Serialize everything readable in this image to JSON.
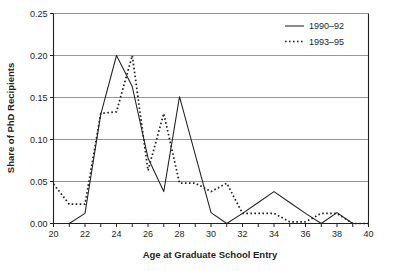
{
  "chart_data": {
    "type": "line",
    "title": "",
    "xlabel": "Age at Graduate School Entry",
    "ylabel": "Share of PhD Recipients",
    "xlim": [
      20,
      40
    ],
    "ylim": [
      0.0,
      0.25
    ],
    "grid": true,
    "grid_axis": "y",
    "legend_position": "top-right",
    "x": [
      20,
      21,
      22,
      23,
      24,
      25,
      26,
      27,
      28,
      29,
      30,
      31,
      32,
      33,
      34,
      35,
      36,
      37,
      38,
      39,
      40
    ],
    "xticks": [
      20,
      21,
      22,
      23,
      24,
      25,
      26,
      27,
      28,
      29,
      30,
      31,
      32,
      33,
      34,
      35,
      36,
      37,
      38,
      39,
      40
    ],
    "xtick_labels": [
      "20",
      "",
      "22",
      "",
      "24",
      "",
      "26",
      "",
      "28",
      "",
      "30",
      "",
      "32",
      "",
      "34",
      "",
      "36",
      "",
      "38",
      "",
      "40"
    ],
    "yticks": [
      0.0,
      0.05,
      0.1,
      0.15,
      0.2,
      0.25
    ],
    "ytick_labels": [
      "0.00",
      "0.05",
      "0.10",
      "0.15",
      "0.20",
      "0.25"
    ],
    "series": [
      {
        "name": "1990–92",
        "style": "solid",
        "color": "#231f20",
        "values": [
          0.0,
          0.0,
          0.012,
          0.13,
          0.2,
          0.163,
          0.078,
          0.038,
          0.151,
          0.082,
          0.013,
          0.0,
          0.012,
          0.025,
          0.038,
          0.025,
          0.012,
          0.0,
          0.013,
          0.0,
          0.0
        ]
      },
      {
        "name": "1993–95",
        "style": "dotted",
        "color": "#231f20",
        "values": [
          0.047,
          0.023,
          0.023,
          0.131,
          0.133,
          0.2,
          0.063,
          0.131,
          0.048,
          0.048,
          0.038,
          0.048,
          0.012,
          0.012,
          0.012,
          0.002,
          0.002,
          0.012,
          0.012,
          0.0,
          0.0
        ]
      }
    ]
  },
  "legend": {
    "items": [
      {
        "label": "1990–92",
        "style": "solid"
      },
      {
        "label": "1993–95",
        "style": "dotted"
      }
    ]
  }
}
